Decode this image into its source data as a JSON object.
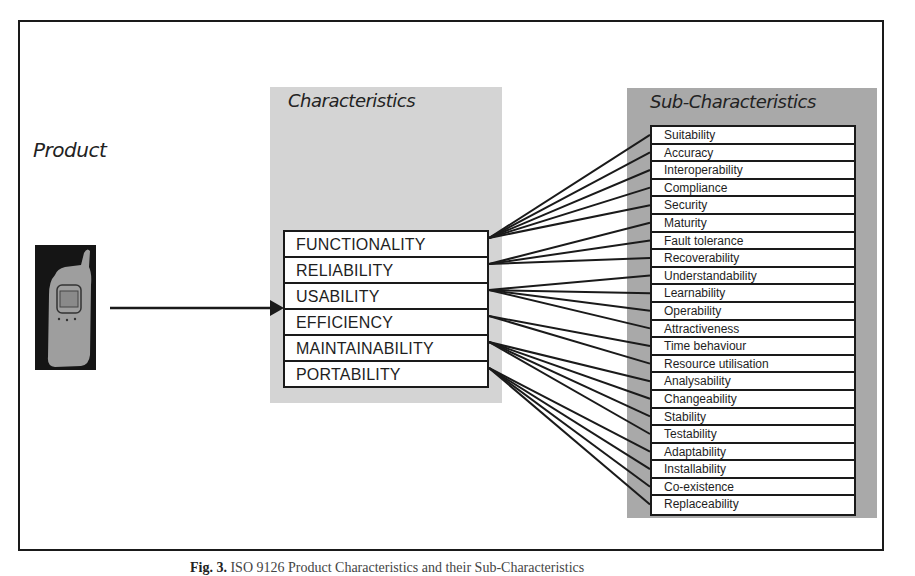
{
  "diagram": {
    "product_label": "Product",
    "product_icon": "mobile-phone-icon",
    "characteristics_title": "Characteristics",
    "sub_characteristics_title": "Sub-Characteristics",
    "characteristics": [
      {
        "label": "FUNCTIONALITY",
        "subs": [
          "Suitability",
          "Accuracy",
          "Interoperability",
          "Compliance",
          "Security"
        ]
      },
      {
        "label": "RELIABILITY",
        "subs": [
          "Maturity",
          "Fault tolerance",
          "Recoverability"
        ]
      },
      {
        "label": "USABILITY",
        "subs": [
          "Understandability",
          "Learnability",
          "Operability",
          "Attractiveness"
        ]
      },
      {
        "label": "EFFICIENCY",
        "subs": [
          "Time behaviour",
          "Resource utilisation"
        ]
      },
      {
        "label": "MAINTAINABILITY",
        "subs": [
          "Analysability",
          "Changeability",
          "Stability",
          "Testability"
        ]
      },
      {
        "label": "PORTABILITY",
        "subs": [
          "Adaptability",
          "Installability",
          "Co-existence",
          "Replaceability"
        ]
      }
    ],
    "sub_characteristics": [
      "Suitability",
      "Accuracy",
      "Interoperability",
      "Compliance",
      "Security",
      "Maturity",
      "Fault tolerance",
      "Recoverability",
      "Understandability",
      "Learnability",
      "Operability",
      "Attractiveness",
      "Time behaviour",
      "Resource utilisation",
      "Analysability",
      "Changeability",
      "Stability",
      "Testability",
      "Adaptability",
      "Installability",
      "Co-existence",
      "Replaceability"
    ],
    "colors": {
      "characteristics_panel": "#d4d4d4",
      "sub_characteristics_panel": "#a9a9a9",
      "lines": "#1a1a1a"
    }
  },
  "caption": {
    "prefix": "Fig. 3.",
    "text": "ISO 9126 Product Characteristics and their Sub-Characteristics"
  }
}
